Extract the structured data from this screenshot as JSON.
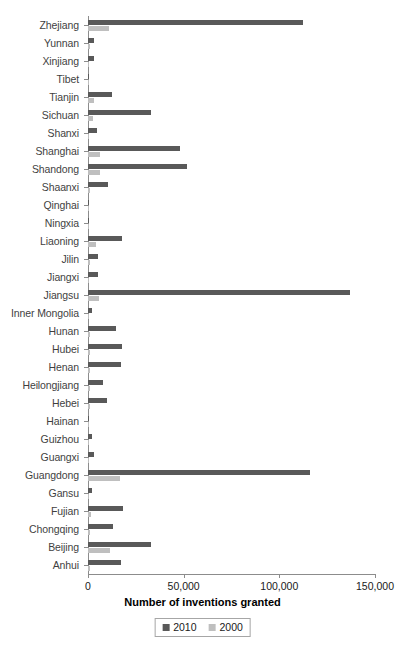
{
  "chart_data": {
    "type": "bar",
    "orientation": "horizontal",
    "title": "",
    "xlabel": "Number of inventions granted",
    "ylabel": "",
    "xlim": [
      0,
      150000
    ],
    "xticks": [
      0,
      50000,
      100000,
      150000
    ],
    "xticklabels": [
      "0",
      "50,000",
      "100,000",
      "150,000"
    ],
    "grid": false,
    "legend_position": "bottom",
    "colors": {
      "2010": "#595959",
      "2000": "#bfbfbf",
      "axis": "#8c8c8c",
      "label": "#3f3f3f"
    },
    "categories": [
      "Zhejiang",
      "Yunnan",
      "Xinjiang",
      "Tibet",
      "Tianjin",
      "Sichuan",
      "Shanxi",
      "Shanghai",
      "Shandong",
      "Shaanxi",
      "Qinghai",
      "Ningxia",
      "Liaoning",
      "Jilin",
      "Jiangxi",
      "Jiangsu",
      "Inner Mongolia",
      "Hunan",
      "Hubei",
      "Henan",
      "Heilongjiang",
      "Hebei",
      "Hainan",
      "Guizhou",
      "Guangxi",
      "Guangdong",
      "Gansu",
      "Fujian",
      "Chongqing",
      "Beijing",
      "Anhui"
    ],
    "series": [
      {
        "name": "2010",
        "color": "#595959",
        "values": [
          112400,
          3200,
          3100,
          300,
          12500,
          33000,
          4700,
          48000,
          52000,
          10500,
          600,
          700,
          18000,
          5000,
          5000,
          137000,
          2000,
          14500,
          18000,
          17000,
          8000,
          10000,
          700,
          2100,
          3100,
          116000,
          2000,
          18500,
          13000,
          33000,
          17500
        ]
      },
      {
        "name": "2000",
        "color": "#bfbfbf",
        "values": [
          11000,
          800,
          400,
          100,
          3000,
          2500,
          700,
          6500,
          6500,
          1200,
          100,
          100,
          4000,
          800,
          600,
          5500,
          300,
          1200,
          1300,
          1200,
          1300,
          1100,
          200,
          300,
          400,
          16500,
          400,
          1800,
          900,
          11500,
          1200
        ]
      }
    ]
  },
  "legend": {
    "items": [
      {
        "label": "2010",
        "color": "#595959"
      },
      {
        "label": "2000",
        "color": "#bfbfbf"
      }
    ]
  }
}
